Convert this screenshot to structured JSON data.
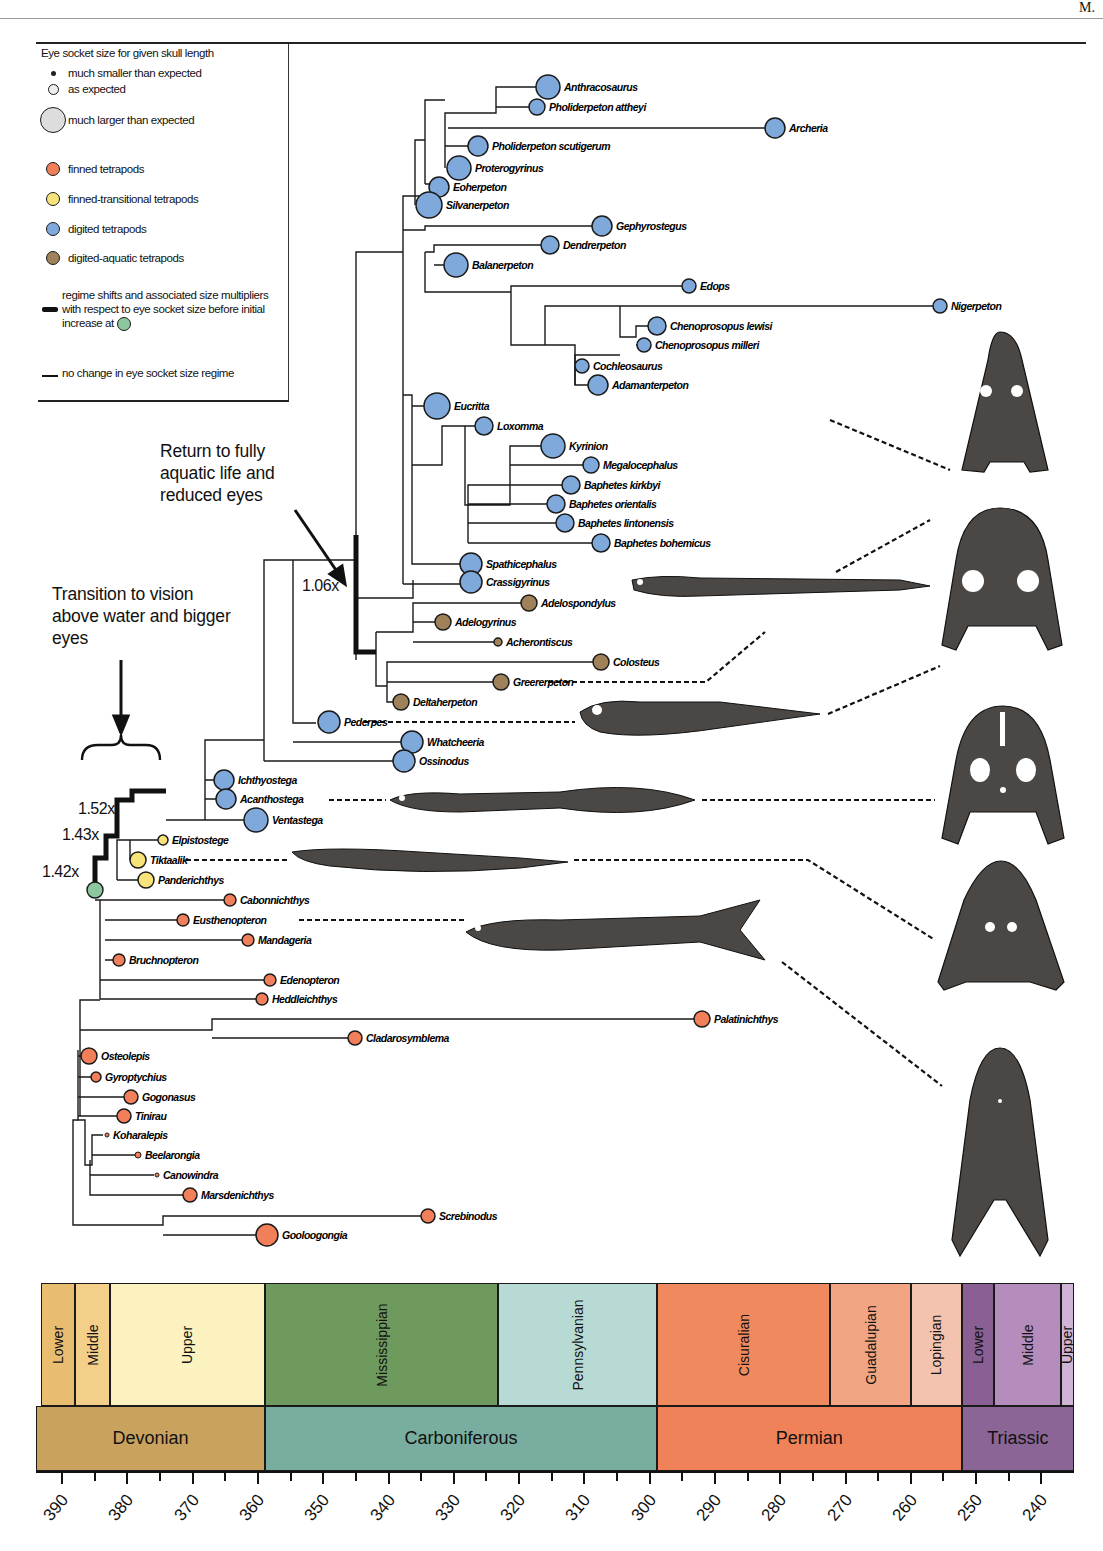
{
  "page": {
    "corner_text": "M."
  },
  "legend": {
    "title": "Eye socket size for given skull length",
    "size_items": [
      {
        "label": "much smaller than expected",
        "size": 5
      },
      {
        "label": "as expected",
        "size": 11
      },
      {
        "label": "much larger than expected",
        "size": 26
      }
    ],
    "color_items": [
      {
        "label": "finned tetrapods",
        "color": "#f07f5a"
      },
      {
        "label": "finned-transitional tetrapods",
        "color": "#f7e37a"
      },
      {
        "label": "digited tetrapods",
        "color": "#7fa8db"
      },
      {
        "label": "digited-aquatic tetrapods",
        "color": "#a0825a"
      }
    ],
    "regime_shift_label": "regime shifts and associated size multipliers with respect to eye socket size before initial increase at",
    "regime_shift_marker_color": "#8cc79e",
    "no_change_label": "no change in eye socket size regime"
  },
  "annotations": {
    "return_aquatic": "Return to fully aquatic life and reduced eyes",
    "transition_vision": "Transition to vision above water and bigger eyes",
    "multipliers": [
      "1.06x",
      "1.52x",
      "1.43x",
      "1.42x"
    ]
  },
  "colors": {
    "finned": "#f07f5a",
    "transitional": "#f7e37a",
    "digited": "#7fa8db",
    "aquatic": "#a0825a",
    "root": "#8cc79e",
    "silhouette": "#4a4744"
  },
  "taxa": [
    {
      "name": "Anthracosaurus",
      "x": 548,
      "y": 87,
      "r": 12,
      "g": "digited"
    },
    {
      "name": "Pholiderpeton attheyi",
      "x": 537,
      "y": 107,
      "r": 8,
      "g": "digited"
    },
    {
      "name": "Archeria",
      "x": 775,
      "y": 128,
      "r": 10,
      "g": "digited"
    },
    {
      "name": "Pholiderpeton scutigerum",
      "x": 478,
      "y": 146,
      "r": 10,
      "g": "digited"
    },
    {
      "name": "Proterogyrinus",
      "x": 459,
      "y": 168,
      "r": 12,
      "g": "digited"
    },
    {
      "name": "Eoherpeton",
      "x": 439,
      "y": 187,
      "r": 10,
      "g": "digited"
    },
    {
      "name": "Silvanerpeton",
      "x": 429,
      "y": 205,
      "r": 13,
      "g": "digited"
    },
    {
      "name": "Gephyrostegus",
      "x": 602,
      "y": 226,
      "r": 10,
      "g": "digited"
    },
    {
      "name": "Dendrerpeton",
      "x": 550,
      "y": 245,
      "r": 9,
      "g": "digited"
    },
    {
      "name": "Balanerpeton",
      "x": 456,
      "y": 265,
      "r": 12,
      "g": "digited"
    },
    {
      "name": "Edops",
      "x": 689,
      "y": 286,
      "r": 7,
      "g": "digited"
    },
    {
      "name": "Nigerpeton",
      "x": 940,
      "y": 306,
      "r": 7,
      "g": "digited"
    },
    {
      "name": "Chenoprosopus lewisi",
      "x": 657,
      "y": 326,
      "r": 9,
      "g": "digited"
    },
    {
      "name": "Chenoprosopus milleri",
      "x": 644,
      "y": 345,
      "r": 7,
      "g": "digited"
    },
    {
      "name": "Cochleosaurus",
      "x": 582,
      "y": 366,
      "r": 7,
      "g": "digited"
    },
    {
      "name": "Adamanterpeton",
      "x": 598,
      "y": 385,
      "r": 10,
      "g": "digited"
    },
    {
      "name": "Eucritta",
      "x": 437,
      "y": 406,
      "r": 13,
      "g": "digited"
    },
    {
      "name": "Loxomma",
      "x": 484,
      "y": 426,
      "r": 9,
      "g": "digited"
    },
    {
      "name": "Kyrinion",
      "x": 553,
      "y": 446,
      "r": 12,
      "g": "digited"
    },
    {
      "name": "Megalocephalus",
      "x": 591,
      "y": 465,
      "r": 8,
      "g": "digited"
    },
    {
      "name": "Baphetes kirkbyi",
      "x": 571,
      "y": 485,
      "r": 9,
      "g": "digited"
    },
    {
      "name": "Baphetes orientalis",
      "x": 556,
      "y": 504,
      "r": 9,
      "g": "digited"
    },
    {
      "name": "Baphetes lintonensis",
      "x": 565,
      "y": 523,
      "r": 9,
      "g": "digited"
    },
    {
      "name": "Baphetes bohemicus",
      "x": 601,
      "y": 543,
      "r": 9,
      "g": "digited"
    },
    {
      "name": "Spathicephalus",
      "x": 471,
      "y": 564,
      "r": 11,
      "g": "digited"
    },
    {
      "name": "Crassigyrinus",
      "x": 471,
      "y": 582,
      "r": 11,
      "g": "digited"
    },
    {
      "name": "Adelospondylus",
      "x": 529,
      "y": 603,
      "r": 8,
      "g": "aquatic"
    },
    {
      "name": "Adelogyrinus",
      "x": 443,
      "y": 622,
      "r": 8,
      "g": "aquatic"
    },
    {
      "name": "Acherontiscus",
      "x": 498,
      "y": 642,
      "r": 4,
      "g": "aquatic"
    },
    {
      "name": "Colosteus",
      "x": 601,
      "y": 662,
      "r": 8,
      "g": "aquatic"
    },
    {
      "name": "Greererpeton",
      "x": 501,
      "y": 682,
      "r": 8,
      "g": "aquatic"
    },
    {
      "name": "Deltaherpeton",
      "x": 401,
      "y": 702,
      "r": 8,
      "g": "aquatic"
    },
    {
      "name": "Pederpes",
      "x": 329,
      "y": 722,
      "r": 11,
      "g": "digited"
    },
    {
      "name": "Whatcheeria",
      "x": 412,
      "y": 742,
      "r": 11,
      "g": "digited"
    },
    {
      "name": "Ossinodus",
      "x": 404,
      "y": 761,
      "r": 11,
      "g": "digited"
    },
    {
      "name": "Ichthyostega",
      "x": 224,
      "y": 780,
      "r": 10,
      "g": "digited"
    },
    {
      "name": "Acanthostega",
      "x": 226,
      "y": 799,
      "r": 10,
      "g": "digited"
    },
    {
      "name": "Ventastega",
      "x": 256,
      "y": 820,
      "r": 12,
      "g": "digited"
    },
    {
      "name": "Elpistostege",
      "x": 163,
      "y": 840,
      "r": 5,
      "g": "transitional"
    },
    {
      "name": "Tiktaalik",
      "x": 138,
      "y": 860,
      "r": 8,
      "g": "transitional"
    },
    {
      "name": "Panderichthys",
      "x": 146,
      "y": 880,
      "r": 8,
      "g": "transitional"
    },
    {
      "name": "Cabonnichthys",
      "x": 230,
      "y": 900,
      "r": 6,
      "g": "finned"
    },
    {
      "name": "Eusthenopteron",
      "x": 183,
      "y": 920,
      "r": 6,
      "g": "finned"
    },
    {
      "name": "Mandageria",
      "x": 248,
      "y": 940,
      "r": 6,
      "g": "finned"
    },
    {
      "name": "Bruchnopteron",
      "x": 119,
      "y": 960,
      "r": 6,
      "g": "finned"
    },
    {
      "name": "Edenopteron",
      "x": 270,
      "y": 980,
      "r": 6,
      "g": "finned"
    },
    {
      "name": "Heddleichthys",
      "x": 262,
      "y": 999,
      "r": 6,
      "g": "finned"
    },
    {
      "name": "Palatinichthys",
      "x": 702,
      "y": 1019,
      "r": 8,
      "g": "finned"
    },
    {
      "name": "Cladarosymblema",
      "x": 355,
      "y": 1038,
      "r": 7,
      "g": "finned"
    },
    {
      "name": "Osteolepis",
      "x": 89,
      "y": 1056,
      "r": 8,
      "g": "finned"
    },
    {
      "name": "Gyroptychius",
      "x": 96,
      "y": 1077,
      "r": 5,
      "g": "finned"
    },
    {
      "name": "Gogonasus",
      "x": 131,
      "y": 1097,
      "r": 7,
      "g": "finned"
    },
    {
      "name": "Tinirau",
      "x": 124,
      "y": 1116,
      "r": 7,
      "g": "finned"
    },
    {
      "name": "Koharalepis",
      "x": 107,
      "y": 1135,
      "r": 2,
      "g": "finned"
    },
    {
      "name": "Beelarongia",
      "x": 138,
      "y": 1155,
      "r": 3,
      "g": "finned"
    },
    {
      "name": "Canowindra",
      "x": 157,
      "y": 1175,
      "r": 2,
      "g": "finned"
    },
    {
      "name": "Marsdenichthys",
      "x": 190,
      "y": 1195,
      "r": 7,
      "g": "finned"
    },
    {
      "name": "Screbinodus",
      "x": 428,
      "y": 1216,
      "r": 7,
      "g": "finned"
    },
    {
      "name": "Gooloogongia",
      "x": 267,
      "y": 1235,
      "r": 11,
      "g": "finned"
    }
  ],
  "timescale": {
    "x0": 36,
    "x1": 1074,
    "ma_left": 394,
    "ma_right": 235,
    "epochs": [
      {
        "label": "Lower",
        "start": 393.3,
        "end": 388,
        "color": "#e8bd6f"
      },
      {
        "label": "Middle",
        "start": 388,
        "end": 382.7,
        "color": "#f3cf8a"
      },
      {
        "label": "Upper",
        "start": 382.7,
        "end": 358.9,
        "color": "#fbf2bf"
      },
      {
        "label": "Mississippian",
        "start": 358.9,
        "end": 323.2,
        "color": "#6f9a5e"
      },
      {
        "label": "Pennsylvanian",
        "start": 323.2,
        "end": 298.9,
        "color": "#b7dad4"
      },
      {
        "label": "Cisuralian",
        "start": 298.9,
        "end": 272.3,
        "color": "#f08a5e"
      },
      {
        "label": "Guadalupian",
        "start": 272.3,
        "end": 259.9,
        "color": "#f1a583"
      },
      {
        "label": "Lopingian",
        "start": 259.9,
        "end": 252.2,
        "color": "#f3c3b0"
      },
      {
        "label": "Lower",
        "start": 252.2,
        "end": 247.2,
        "color": "#8a5f93"
      },
      {
        "label": "Middle",
        "start": 247.2,
        "end": 237,
        "color": "#b48dbd"
      },
      {
        "label": "Upper",
        "start": 237,
        "end": 235,
        "color": "#cfb4d6"
      }
    ],
    "periods": [
      {
        "label": "Devonian",
        "start": 394,
        "end": 358.9,
        "color": "#c9a35e"
      },
      {
        "label": "Carboniferous",
        "start": 358.9,
        "end": 298.9,
        "color": "#79ad9f"
      },
      {
        "label": "Permian",
        "start": 298.9,
        "end": 252.2,
        "color": "#ef8258"
      },
      {
        "label": "Triassic",
        "start": 252.2,
        "end": 235,
        "color": "#8a6596"
      }
    ],
    "ticks": [
      390,
      380,
      370,
      360,
      350,
      340,
      330,
      320,
      310,
      300,
      290,
      280,
      270,
      260,
      250,
      240
    ]
  }
}
